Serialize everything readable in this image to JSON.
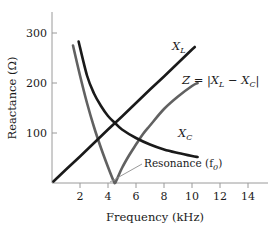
{
  "chart_data": {
    "type": "line",
    "title": "",
    "xlabel": "Frequency (kHz)",
    "ylabel": "Reactance (Ω)",
    "xlim": [
      0,
      15.6
    ],
    "ylim": [
      0,
      330
    ],
    "xticks": [
      2,
      4,
      6,
      8,
      10,
      12,
      14
    ],
    "yticks": [
      100,
      200,
      300
    ],
    "grid": false,
    "legend": "inline-curve-labels",
    "annotations": [
      {
        "text": "Resonance (f₀)",
        "points_to_x": 4.5,
        "points_to_y": 0
      }
    ],
    "series": [
      {
        "name": "X_L",
        "label": "X",
        "label_sub": "L",
        "color": "#1a1a1a",
        "type": "line",
        "description": "inductive reactance, linear increase through origin",
        "x": [
          0.1,
          1,
          2,
          3,
          4,
          4.5,
          5,
          6,
          7,
          8,
          9,
          10,
          10.2
        ],
        "y": [
          3,
          27,
          53,
          80,
          107,
          120,
          133,
          160,
          187,
          213,
          240,
          267,
          272
        ]
      },
      {
        "name": "X_C",
        "label": "X",
        "label_sub": "C",
        "color": "#1a1a1a",
        "type": "curve",
        "description": "capacitive reactance, inverse hyperbolic decay",
        "x": [
          1.9,
          2.5,
          3,
          3.5,
          4,
          4.5,
          5,
          6,
          7,
          8,
          9,
          10,
          10.4
        ],
        "y": [
          283,
          215,
          179,
          154,
          134,
          120,
          107,
          90,
          77,
          67,
          60,
          54,
          52
        ]
      },
      {
        "name": "Z",
        "label": "Z = |X",
        "label_sub": "L",
        "label_mid": " − X",
        "label_sub2": "C",
        "label_end": "|",
        "color": "#616161",
        "type": "curve",
        "description": "impedance magnitude, V shape with minimum at resonance",
        "x": [
          1.5,
          2,
          2.5,
          3,
          3.5,
          4,
          4.4,
          4.5,
          4.6,
          5,
          5.5,
          6,
          6.5,
          7,
          8,
          9,
          10,
          10.4
        ],
        "y": [
          275,
          215,
          160,
          112,
          70,
          32,
          4,
          0,
          5,
          30,
          55,
          77,
          98,
          115,
          148,
          173,
          194,
          200
        ]
      }
    ]
  },
  "axes": {
    "x_title": "Frequency (kHz)",
    "y_title": "Reactance (Ω)",
    "x_tick_labels": [
      "2",
      "4",
      "6",
      "8",
      "10",
      "12",
      "14"
    ],
    "y_tick_labels": [
      "100",
      "200",
      "300"
    ]
  },
  "labels": {
    "xl_base": "X",
    "xl_sub": "L",
    "xc_base": "X",
    "xc_sub": "C",
    "z_full": "Z = |X",
    "z_sub1": "L",
    "z_mid": " − X",
    "z_sub2": "C",
    "z_end": "|",
    "resonance_base": "Resonance (f",
    "resonance_sub": "0",
    "resonance_end": ")"
  },
  "colors": {
    "axis": "#9a9a9a",
    "text": "#1a1a1a",
    "curve_dark": "#1a1a1a",
    "curve_gray": "#616161",
    "leader": "#8d8d8d",
    "background": "#ffffff"
  }
}
